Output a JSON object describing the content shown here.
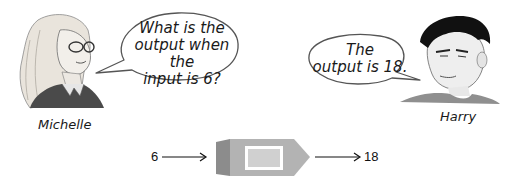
{
  "characters": {
    "michelle": {
      "name": "Michelle",
      "speech": [
        "What is the",
        "output when the",
        "input is 6?"
      ]
    },
    "harry": {
      "name": "Harry",
      "speech": [
        "The",
        "output is 18."
      ]
    }
  },
  "function_machine": {
    "input": "6",
    "output": "18",
    "colors": {
      "body": "#b3b3b3",
      "side": "#8c8c8c",
      "window_border": "#ffffff",
      "window_fill": "#d0d0d0"
    }
  }
}
